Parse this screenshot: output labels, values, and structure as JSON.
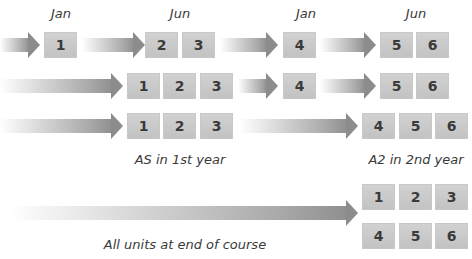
{
  "headers": [
    {
      "label": "Jan",
      "x": 61
    },
    {
      "label": "Jun",
      "x": 180
    },
    {
      "label": "Jan",
      "x": 306
    },
    {
      "label": "Jun",
      "x": 416
    }
  ],
  "rows": [
    {
      "name": "row-modular-four-sittings",
      "arrows": [
        {
          "x": 0,
          "w": 40,
          "y": 32
        },
        {
          "x": 82,
          "w": 63,
          "y": 32
        },
        {
          "x": 220,
          "w": 58,
          "y": 32
        },
        {
          "x": 320,
          "w": 56,
          "y": 32
        }
      ],
      "units": [
        {
          "label": "1",
          "x": 44,
          "y": 32
        },
        {
          "label": "2",
          "x": 145,
          "y": 32
        },
        {
          "label": "3",
          "x": 182,
          "y": 32
        },
        {
          "label": "4",
          "x": 283,
          "y": 32
        },
        {
          "label": "5",
          "x": 380,
          "y": 32
        },
        {
          "label": "6",
          "x": 416,
          "y": 32
        }
      ]
    },
    {
      "name": "row-as-june-then-a2-split",
      "arrows": [
        {
          "x": 0,
          "w": 123,
          "y": 73
        },
        {
          "x": 238,
          "w": 40,
          "y": 73
        },
        {
          "x": 320,
          "w": 56,
          "y": 73
        }
      ],
      "units": [
        {
          "label": "1",
          "x": 127,
          "y": 73
        },
        {
          "label": "2",
          "x": 163,
          "y": 73
        },
        {
          "label": "3",
          "x": 200,
          "y": 73
        },
        {
          "label": "4",
          "x": 283,
          "y": 73
        },
        {
          "label": "5",
          "x": 380,
          "y": 73
        },
        {
          "label": "6",
          "x": 416,
          "y": 73
        }
      ]
    },
    {
      "name": "row-as-then-a2",
      "arrows": [
        {
          "x": 0,
          "w": 123,
          "y": 113
        },
        {
          "x": 240,
          "w": 118,
          "y": 113
        }
      ],
      "units": [
        {
          "label": "1",
          "x": 127,
          "y": 113
        },
        {
          "label": "2",
          "x": 163,
          "y": 113
        },
        {
          "label": "3",
          "x": 200,
          "y": 113
        },
        {
          "label": "4",
          "x": 362,
          "y": 113
        },
        {
          "label": "5",
          "x": 399,
          "y": 113
        },
        {
          "label": "6",
          "x": 435,
          "y": 113
        }
      ]
    },
    {
      "name": "row-linear-end-of-course",
      "arrows": [
        {
          "x": 10,
          "w": 348,
          "y": 200
        }
      ],
      "units": [
        {
          "label": "1",
          "x": 362,
          "y": 184
        },
        {
          "label": "2",
          "x": 399,
          "y": 184
        },
        {
          "label": "3",
          "x": 435,
          "y": 184
        },
        {
          "label": "4",
          "x": 362,
          "y": 223
        },
        {
          "label": "5",
          "x": 399,
          "y": 223
        },
        {
          "label": "6",
          "x": 435,
          "y": 223
        }
      ]
    }
  ],
  "labels": [
    {
      "name": "as-first-year-label",
      "text": "AS in 1st year",
      "x": 180,
      "y": 152
    },
    {
      "name": "a2-second-year-label",
      "text": "A2 in 2nd year",
      "x": 416,
      "y": 152
    },
    {
      "name": "all-units-end-label",
      "text": "All units at end of course",
      "x": 185,
      "y": 237
    }
  ],
  "colors": {
    "box": "#c8c8c8",
    "arrow_head": "#8c8c8c",
    "text": "#3a3a3a"
  }
}
